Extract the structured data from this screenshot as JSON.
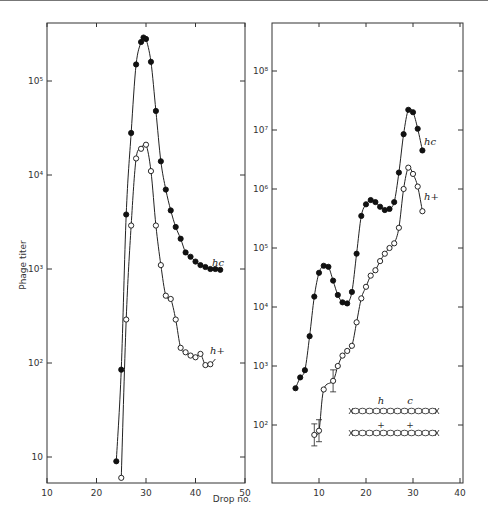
{
  "chart_data": [
    {
      "type": "line",
      "panel": "left",
      "xlabel": "Drop no.",
      "ylabel": "Phage titer",
      "yscale": "log",
      "xlim": [
        10,
        50
      ],
      "ylim": [
        5,
        400000
      ],
      "xticks": [
        10,
        20,
        30,
        40,
        50
      ],
      "yticks": [
        {
          "v": 10,
          "label": "10"
        },
        {
          "v": 100,
          "label": "10²"
        },
        {
          "v": 1000,
          "label": "10³"
        },
        {
          "v": 10000,
          "label": "10⁴"
        },
        {
          "v": 100000,
          "label": "10⁵"
        }
      ],
      "series": [
        {
          "name": "hc",
          "marker": "filled",
          "x": [
            24,
            25,
            26,
            27,
            28,
            29,
            29.5,
            30,
            31,
            32,
            33,
            34,
            35,
            36,
            37,
            38,
            39,
            40,
            41,
            42,
            43,
            44,
            45
          ],
          "y": [
            9,
            85,
            3800,
            28000,
            150000,
            260000,
            290000,
            280000,
            160000,
            48000,
            14000,
            7000,
            4200,
            2800,
            2100,
            1500,
            1350,
            1200,
            1100,
            1050,
            1000,
            1000,
            980
          ]
        },
        {
          "name": "h+",
          "marker": "open",
          "x": [
            25,
            26,
            27,
            28,
            29,
            30,
            31,
            32,
            33,
            34,
            35,
            36,
            37,
            38,
            39,
            40,
            41,
            42,
            43
          ],
          "y": [
            6,
            290,
            2900,
            15000,
            19000,
            21000,
            11000,
            2900,
            1100,
            520,
            480,
            290,
            145,
            130,
            120,
            115,
            125,
            95,
            97
          ]
        }
      ],
      "line_ends": {
        "h+": [
          44,
          110
        ]
      }
    },
    {
      "type": "line",
      "panel": "right",
      "xlabel": "",
      "ylabel": "",
      "yscale": "log",
      "xlim": [
        0,
        40
      ],
      "ylim": [
        10,
        500000000
      ],
      "xticks": [
        10,
        20,
        30,
        40
      ],
      "yticks": [
        {
          "v": 100,
          "label": "10²"
        },
        {
          "v": 1000,
          "label": "10³"
        },
        {
          "v": 10000,
          "label": "10⁴"
        },
        {
          "v": 100000,
          "label": "10⁵"
        },
        {
          "v": 1000000,
          "label": "10⁶"
        },
        {
          "v": 10000000,
          "label": "10⁷"
        },
        {
          "v": 100000000,
          "label": "10⁸"
        }
      ],
      "series": [
        {
          "name": "hc",
          "marker": "filled",
          "x": [
            5,
            6,
            7,
            8,
            9,
            10,
            11,
            12,
            13,
            14,
            15,
            16,
            17,
            18,
            19,
            20,
            21,
            22,
            23,
            24,
            25,
            26,
            27,
            28,
            29,
            30,
            31,
            32
          ],
          "y": [
            420,
            640,
            850,
            3200,
            15000,
            38000,
            50000,
            48000,
            28000,
            16000,
            12000,
            11500,
            18000,
            80000,
            350000,
            550000,
            650000,
            600000,
            500000,
            440000,
            460000,
            600000,
            1900000,
            8500000,
            22000000,
            20000000,
            10500000,
            4500000
          ]
        },
        {
          "name": "h+",
          "marker": "open",
          "error_bars": [
            9,
            10,
            13
          ],
          "x": [
            9,
            10,
            11,
            13,
            14,
            15,
            16,
            17,
            18,
            19,
            20,
            21,
            22,
            23,
            24,
            25,
            26,
            27,
            28,
            29,
            30,
            31,
            32
          ],
          "y": [
            68,
            80,
            400,
            560,
            1000,
            1500,
            1800,
            2200,
            5500,
            14000,
            22000,
            34000,
            42000,
            60000,
            80000,
            100000,
            120000,
            220000,
            1000000,
            2300000,
            1800000,
            1100000,
            420000
          ]
        }
      ],
      "inset": {
        "top_labels": [
          "h",
          "c"
        ],
        "bottom_labels": [
          "+",
          "+"
        ],
        "beads": 12
      }
    }
  ],
  "labels": {
    "y_axis_title": "Phage titer",
    "x_axis_title": "Drop no.",
    "hc_label": "hc",
    "hplus_label": "h+"
  }
}
